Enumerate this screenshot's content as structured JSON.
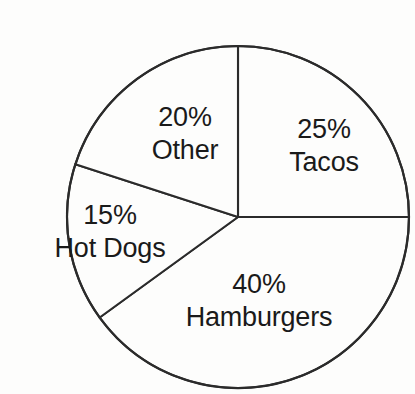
{
  "chart_data": {
    "type": "pie",
    "title": "",
    "subtitle": "",
    "xlabel": "",
    "ylabel": "",
    "legend_position": "none",
    "grid": false,
    "labels_inside_slices": true,
    "total_percent": "100%",
    "categories": [
      "Tacos",
      "Hamburgers",
      "Hot Dogs",
      "Other"
    ],
    "values": [
      25,
      40,
      15,
      20
    ],
    "slices": [
      {
        "name": "Tacos",
        "value": 25,
        "percent_label": "25%",
        "name_label": "Tacos",
        "start_angle_deg": 0,
        "end_angle_deg": 90,
        "color": "#fdfdfc"
      },
      {
        "name": "Hamburgers",
        "value": 40,
        "percent_label": "40%",
        "name_label": "Hamburgers",
        "start_angle_deg": 90,
        "end_angle_deg": 234,
        "color": "#fdfdfc"
      },
      {
        "name": "Hot Dogs",
        "value": 15,
        "percent_label": "15%",
        "name_label": "Hot Dogs",
        "start_angle_deg": 234,
        "end_angle_deg": 288,
        "color": "#fdfdfc"
      },
      {
        "name": "Other",
        "value": 20,
        "percent_label": "20%",
        "name_label": "Other",
        "start_angle_deg": 288,
        "end_angle_deg": 360,
        "color": "#fdfdfc"
      }
    ]
  },
  "style": {
    "background_color": "#fdfdfc",
    "stroke_color": "#2b2b2b",
    "text_color": "#1a1a1a",
    "slice_fill": "#fdfdfc"
  },
  "geometry": {
    "center_x": 198,
    "center_y": 201,
    "radius": 171
  }
}
